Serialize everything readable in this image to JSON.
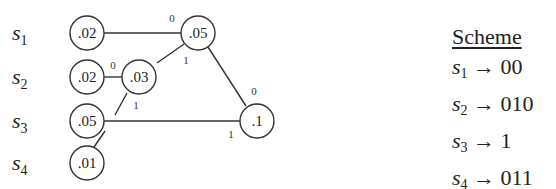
{
  "diagram": {
    "symbols": [
      {
        "name": "s",
        "sub": "1",
        "prob": ".02"
      },
      {
        "name": "s",
        "sub": "2",
        "prob": ".02"
      },
      {
        "name": "s",
        "sub": "3",
        "prob": ".05"
      },
      {
        "name": "s",
        "sub": "4",
        "prob": ".01"
      }
    ],
    "internal_nodes": [
      {
        "id": "n03",
        "prob": ".03"
      },
      {
        "id": "n05",
        "prob": ".05"
      },
      {
        "id": "n1",
        "prob": ".1"
      }
    ],
    "edges": [
      {
        "from": "s1",
        "to": "n05",
        "bit": "0"
      },
      {
        "from": "n03",
        "to": "n05",
        "bit": "1"
      },
      {
        "from": "s2",
        "to": "n03",
        "bit": "0"
      },
      {
        "from": "s4",
        "to": "n03",
        "bit": "1"
      },
      {
        "from": "n05",
        "to": "n1",
        "bit": "0"
      },
      {
        "from": "s3",
        "to": "n1",
        "bit": "1"
      }
    ]
  },
  "scheme": {
    "title": "Scheme",
    "rows": [
      {
        "sym": "s",
        "sub": "1",
        "arrow": "→",
        "code": "00"
      },
      {
        "sym": "s",
        "sub": "2",
        "arrow": "→",
        "code": "010"
      },
      {
        "sym": "s",
        "sub": "3",
        "arrow": "→",
        "code": "1"
      },
      {
        "sym": "s",
        "sub": "4",
        "arrow": "→",
        "code": "011"
      }
    ]
  }
}
